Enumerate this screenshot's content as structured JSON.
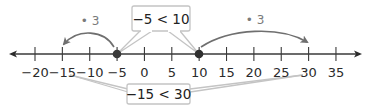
{
  "diagram": {
    "type": "number-line",
    "axis": {
      "min_tick": -20,
      "max_tick": 35,
      "step": 5,
      "ticks": [
        -20,
        -15,
        -10,
        -5,
        0,
        5,
        10,
        15,
        20,
        25,
        30,
        35
      ],
      "tick_labels": [
        "−20",
        "−15",
        "−10",
        "−5",
        "0",
        "5",
        "10",
        "15",
        "20",
        "25",
        "30",
        "35"
      ],
      "arrows": "both"
    },
    "points": [
      {
        "value": -5,
        "label": "−5"
      },
      {
        "value": 10,
        "label": "10"
      }
    ],
    "arcs": [
      {
        "from": -5,
        "to": -15,
        "operation": "• 3",
        "direction": "left"
      },
      {
        "from": 10,
        "to": 30,
        "operation": "• 3",
        "direction": "right"
      }
    ],
    "callouts": {
      "top": "−5 < 10",
      "bottom": "−15 < 30"
    },
    "colors": {
      "axis": "#3a3a3a",
      "point": "#3a3a3a",
      "arc": "#6f6f6f",
      "callout_border": "#bdbdbd",
      "operation_text": "#7a7a7a"
    }
  }
}
